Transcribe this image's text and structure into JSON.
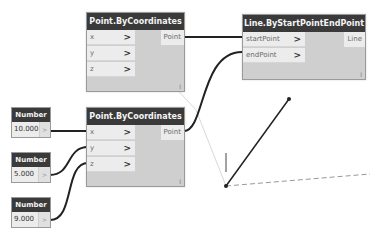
{
  "nodes": {
    "point_top": {
      "title": "Point.ByCoordinates",
      "inputs": [
        {
          "label": "x",
          "chevron": ">"
        },
        {
          "label": "y",
          "chevron": ">"
        },
        {
          "label": "z",
          "chevron": ">"
        }
      ],
      "output": "Point",
      "lacing": "l"
    },
    "point_bottom": {
      "title": "Point.ByCoordinates",
      "inputs": [
        {
          "label": "x",
          "chevron": ">"
        },
        {
          "label": "y",
          "chevron": ">"
        },
        {
          "label": "z",
          "chevron": ">"
        }
      ],
      "output": "Point",
      "lacing": "l"
    },
    "line": {
      "title": "Line.ByStartPointEndPoint",
      "inputs": [
        {
          "label": "startPoint",
          "chevron": ">"
        },
        {
          "label": "endPoint",
          "chevron": ">"
        }
      ],
      "output": "Line",
      "lacing": "l"
    },
    "numbers": [
      {
        "title": "Number",
        "value": "10.000",
        "arrow": ">"
      },
      {
        "title": "Number",
        "value": "5.000",
        "arrow": ">"
      },
      {
        "title": "Number",
        "value": "9.000",
        "arrow": ">"
      }
    ]
  },
  "colors": {
    "node_header": "#3a3a3a",
    "node_body": "#cfcfcf",
    "port": "#ececec",
    "wire": "#222222",
    "geometry_line": "#222222",
    "axis_dashed": "#999999"
  }
}
